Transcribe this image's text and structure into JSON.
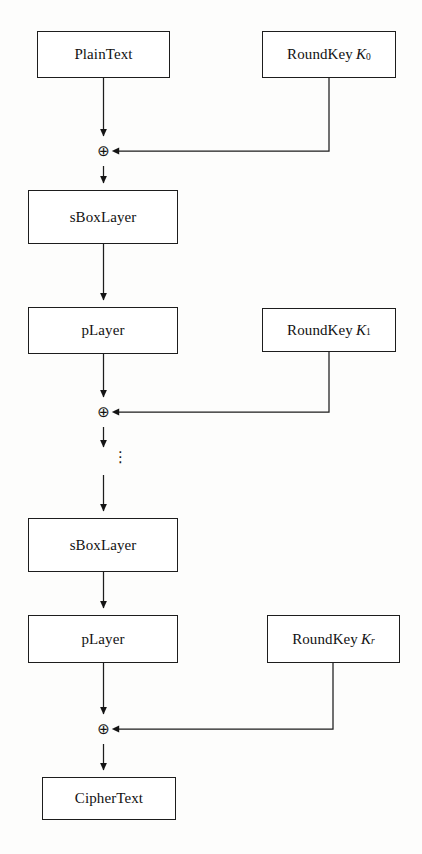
{
  "figure": {
    "background_color": "#fdfdfc",
    "line_color": "#1d1d1d",
    "text_color": "#111111"
  },
  "nodes": {
    "plaintext": {
      "label": "PlainText",
      "x": 37,
      "y": 31,
      "w": 133,
      "h": 47
    },
    "roundkey0": {
      "label": "RoundKey",
      "var": "K",
      "sub": "0",
      "sub_italic": false,
      "x": 262,
      "y": 31,
      "w": 134,
      "h": 47
    },
    "sboxlayer_top": {
      "label": "sBoxLayer",
      "x": 28,
      "y": 190,
      "w": 150,
      "h": 54
    },
    "players_top": {
      "label": "pLayer",
      "x": 28,
      "y": 307,
      "w": 150,
      "h": 47
    },
    "roundkey1": {
      "label": "RoundKey",
      "var": "K",
      "sub": "1",
      "sub_italic": false,
      "x": 262,
      "y": 308,
      "w": 134,
      "h": 44
    },
    "sboxlayer_bottom": {
      "label": "sBoxLayer",
      "x": 28,
      "y": 518,
      "w": 150,
      "h": 54
    },
    "players_bottom": {
      "label": "pLayer",
      "x": 28,
      "y": 615,
      "w": 150,
      "h": 48
    },
    "roundkey_r": {
      "label": "RoundKey",
      "var": "K",
      "sub": "r",
      "sub_italic": true,
      "x": 267,
      "y": 615,
      "w": 133,
      "h": 48
    },
    "ciphertext": {
      "label": "CipherText",
      "x": 42,
      "y": 777,
      "w": 134,
      "h": 43
    }
  },
  "operators": {
    "xor_symbol": "⊕",
    "vdots_symbol": "⋮",
    "xor_top": {
      "cx": 103,
      "cy": 151
    },
    "xor_middle": {
      "cx": 103,
      "cy": 412
    },
    "xor_bottom": {
      "cx": 103,
      "cy": 729
    },
    "vdots": {
      "cx": 118,
      "cy": 460
    }
  },
  "connections": [
    {
      "name": "plaintext-to-xor-top",
      "kind": "arrow-down",
      "from": "plaintext",
      "to": "xor_top"
    },
    {
      "name": "roundkey0-to-xor-top",
      "kind": "elbow-left-arrow",
      "from": "roundkey0",
      "to": "xor_top"
    },
    {
      "name": "xor-top-to-sboxlayer-top",
      "kind": "arrow-down",
      "from": "xor_top",
      "to": "sboxlayer_top"
    },
    {
      "name": "sboxlayer-top-to-players-top",
      "kind": "arrow-down",
      "from": "sboxlayer_top",
      "to": "players_top"
    },
    {
      "name": "players-top-to-xor-middle",
      "kind": "arrow-down",
      "from": "players_top",
      "to": "xor_middle"
    },
    {
      "name": "roundkey1-to-xor-middle",
      "kind": "elbow-left-arrow",
      "from": "roundkey1",
      "to": "xor_middle"
    },
    {
      "name": "xor-middle-to-vdots",
      "kind": "arrow-down",
      "from": "xor_middle",
      "to": "vdots"
    },
    {
      "name": "vdots-to-sboxlayer-bottom",
      "kind": "arrow-down",
      "from": "vdots",
      "to": "sboxlayer_bottom"
    },
    {
      "name": "sboxlayer-bottom-to-players-bottom",
      "kind": "arrow-down",
      "from": "sboxlayer_bottom",
      "to": "players_bottom"
    },
    {
      "name": "players-bottom-to-xor-bottom",
      "kind": "arrow-down",
      "from": "players_bottom",
      "to": "xor_bottom"
    },
    {
      "name": "roundkey-r-to-xor-bottom",
      "kind": "elbow-left-arrow",
      "from": "roundkey_r",
      "to": "xor_bottom"
    },
    {
      "name": "xor-bottom-to-ciphertext",
      "kind": "arrow-down",
      "from": "xor_bottom",
      "to": "ciphertext"
    }
  ],
  "caption": {
    "text": ""
  }
}
